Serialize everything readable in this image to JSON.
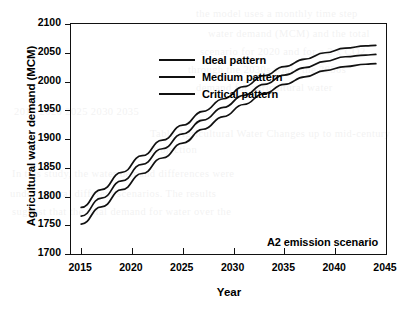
{
  "figure": {
    "xlabel": "Year",
    "ylabel": "Agricultural water demand (MCM)",
    "annotation": "A2 emission scenario"
  },
  "legend": {
    "items": [
      {
        "label": "Ideal pattern",
        "color": "#111111"
      },
      {
        "label": "Medium pattern",
        "color": "#111111"
      },
      {
        "label": "Critical pattern",
        "color": "#111111"
      }
    ]
  },
  "axes": {
    "y_ticks": [
      "2100",
      "2050",
      "2000",
      "1950",
      "1900",
      "1850",
      "1800",
      "1750",
      "1700"
    ],
    "x_ticks": [
      "2015",
      "2020",
      "2025",
      "2030",
      "2035",
      "2040",
      "2045"
    ]
  },
  "bleed_text": {
    "lines": [
      "the model uses a monthly time step",
      "water demand (MCM) and the total",
      "scenario for 2020 and for a 2 x CO2",
      "through the 2030s while the 2050s",
      "demand for agricultural water",
      "2015   2020   2025   2030   2035",
      "Table  Agricultural Water Changes up to mid-century",
      "Projection",
      "In this study, the water demand differences were",
      "under several different scenarios. The results",
      "suggest that the total demand for water over the"
    ]
  },
  "chart_data": {
    "type": "line",
    "title": "",
    "subtitle": "",
    "xlabel": "Year",
    "ylabel": "Agricultural water demand (MCM)",
    "annotation": "A2 emission scenario",
    "xlim": [
      2014,
      2045
    ],
    "ylim": [
      1700,
      2100
    ],
    "ytick_interval": 50,
    "xtick_interval": 5,
    "grid": false,
    "legend_position": "top-left",
    "x": [
      2015,
      2017,
      2019,
      2021,
      2023,
      2025,
      2027,
      2029,
      2031,
      2033,
      2035,
      2037,
      2039,
      2041,
      2043,
      2044
    ],
    "series": [
      {
        "name": "Ideal pattern",
        "color": "#111111",
        "values": [
          1781,
          1812,
          1842,
          1871,
          1898,
          1924,
          1948,
          1970,
          1991,
          2010,
          2026,
          2039,
          2050,
          2058,
          2062,
          2063
        ]
      },
      {
        "name": "Medium pattern",
        "color": "#111111",
        "values": [
          1766,
          1797,
          1827,
          1856,
          1883,
          1909,
          1933,
          1955,
          1976,
          1995,
          2011,
          2024,
          2035,
          2043,
          2046,
          2047
        ]
      },
      {
        "name": "Critical pattern",
        "color": "#111111",
        "values": [
          1752,
          1782,
          1812,
          1840,
          1867,
          1893,
          1917,
          1939,
          1960,
          1979,
          1995,
          2008,
          2019,
          2026,
          2030,
          2031
        ]
      }
    ]
  }
}
